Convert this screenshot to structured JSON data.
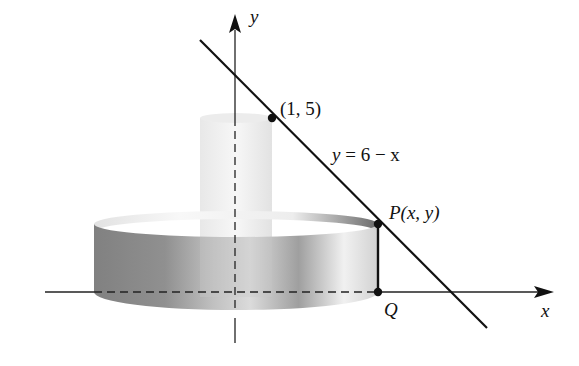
{
  "figure": {
    "axes": {
      "x_label": "x",
      "y_label": "y"
    },
    "line": {
      "equation_label": "y = 6 − x",
      "equation_lhs": "y",
      "equation_rhs": "= 6 − x"
    },
    "points": {
      "intercept_label": "(1, 5)",
      "p_label_name": "P",
      "p_label_coords": "(x, y)",
      "q_label": "Q"
    },
    "colors": {
      "line": "#111111",
      "shell_dark": "#6e6e6e",
      "shell_light": "#f2f2f2",
      "inner_cylinder": "#e6e6e6"
    }
  }
}
